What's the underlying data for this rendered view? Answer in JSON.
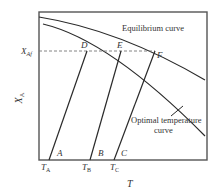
{
  "diagram": {
    "title": "",
    "axes": {
      "x_label": "T",
      "y_label_main": "X",
      "y_label_sub": "A"
    },
    "y_marker": {
      "main": "X",
      "sub": "Af"
    },
    "curves": {
      "equilibrium": "Equilibrium curve",
      "optimal_line1": "Optimal temperature",
      "optimal_line2": "curve"
    },
    "points": {
      "D": "D",
      "E": "E",
      "F": "F",
      "A": "A",
      "B": "B",
      "C": "C"
    },
    "temperatures": [
      {
        "main": "T",
        "sub": "A"
      },
      {
        "main": "T",
        "sub": "B"
      },
      {
        "main": "T",
        "sub": "C"
      }
    ],
    "colors": {
      "line": "#2a2a2a",
      "frame": "#555555",
      "dashed": "#777777",
      "text": "#333333"
    }
  }
}
